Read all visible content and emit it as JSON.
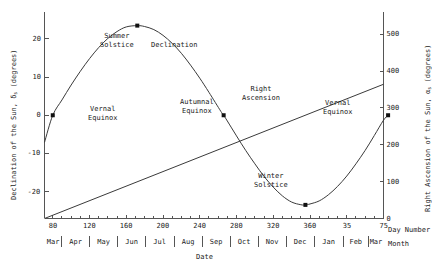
{
  "chart_data": {
    "type": "line",
    "title": "",
    "xlabel": "Date",
    "x2label": "Day Number",
    "x3label": "Month",
    "ylabel": "Declination of the Sun, δs (degrees)",
    "y2label": "Right Ascension of the Sun, αs (degrees)",
    "xlim": [
      71,
      440
    ],
    "ylim": [
      -27,
      27
    ],
    "y2lim": [
      0,
      560
    ],
    "grid": false,
    "legend": "none",
    "x_ticks": [
      {
        "day": 80,
        "label": "80"
      },
      {
        "day": 120,
        "label": "120"
      },
      {
        "day": 160,
        "label": "160"
      },
      {
        "day": 200,
        "label": "200"
      },
      {
        "day": 240,
        "label": "240"
      },
      {
        "day": 280,
        "label": "280"
      },
      {
        "day": 320,
        "label": "320"
      },
      {
        "day": 360,
        "label": "360"
      },
      {
        "day": 400,
        "label": "35"
      },
      {
        "day": 440,
        "label": "75"
      }
    ],
    "y_ticks": [
      {
        "value": 20,
        "label": "20"
      },
      {
        "value": 10,
        "label": "10"
      },
      {
        "value": 0,
        "label": "0"
      },
      {
        "value": -10,
        "label": "-10"
      },
      {
        "value": -20,
        "label": "-20"
      }
    ],
    "y2_ticks": [
      {
        "value": 500,
        "label": "500"
      },
      {
        "value": 400,
        "label": "400"
      },
      {
        "value": 300,
        "label": "300"
      },
      {
        "value": 200,
        "label": "200"
      },
      {
        "value": 100,
        "label": "100"
      },
      {
        "value": 0,
        "label": "0"
      }
    ],
    "months": [
      {
        "label": "Mar",
        "start": 60,
        "end": 90
      },
      {
        "label": "Apr",
        "start": 90,
        "end": 120
      },
      {
        "label": "May",
        "start": 120,
        "end": 151
      },
      {
        "label": "Jun",
        "start": 151,
        "end": 181
      },
      {
        "label": "Jul",
        "start": 181,
        "end": 212
      },
      {
        "label": "Aug",
        "start": 212,
        "end": 243
      },
      {
        "label": "Sep",
        "start": 243,
        "end": 273
      },
      {
        "label": "Oct",
        "start": 273,
        "end": 304
      },
      {
        "label": "Nov",
        "start": 304,
        "end": 334
      },
      {
        "label": "Dec",
        "start": 334,
        "end": 365
      },
      {
        "label": "Jan",
        "start": 365,
        "end": 396
      },
      {
        "label": "Feb",
        "start": 396,
        "end": 424
      },
      {
        "label": "Mar",
        "start": 424,
        "end": 455
      }
    ],
    "series": [
      {
        "name": "Declination",
        "unit": "degrees",
        "axis": "left",
        "points": [
          {
            "day": 71,
            "value": -7.1
          },
          {
            "day": 80,
            "value": 0.0
          },
          {
            "day": 90,
            "value": 4.0
          },
          {
            "day": 100,
            "value": 7.9
          },
          {
            "day": 110,
            "value": 11.5
          },
          {
            "day": 120,
            "value": 14.8
          },
          {
            "day": 130,
            "value": 17.7
          },
          {
            "day": 140,
            "value": 20.1
          },
          {
            "day": 150,
            "value": 21.9
          },
          {
            "day": 160,
            "value": 23.1
          },
          {
            "day": 172,
            "value": 23.44
          },
          {
            "day": 180,
            "value": 23.2
          },
          {
            "day": 190,
            "value": 22.4
          },
          {
            "day": 200,
            "value": 20.9
          },
          {
            "day": 210,
            "value": 18.8
          },
          {
            "day": 220,
            "value": 16.2
          },
          {
            "day": 230,
            "value": 13.1
          },
          {
            "day": 240,
            "value": 9.7
          },
          {
            "day": 250,
            "value": 6.0
          },
          {
            "day": 263,
            "value": 1.0
          },
          {
            "day": 266,
            "value": 0.0
          },
          {
            "day": 270,
            "value": -1.5
          },
          {
            "day": 280,
            "value": -5.4
          },
          {
            "day": 290,
            "value": -9.2
          },
          {
            "day": 300,
            "value": -12.7
          },
          {
            "day": 310,
            "value": -16.0
          },
          {
            "day": 320,
            "value": -18.8
          },
          {
            "day": 330,
            "value": -21.1
          },
          {
            "day": 340,
            "value": -22.7
          },
          {
            "day": 350,
            "value": -23.4
          },
          {
            "day": 355,
            "value": -23.44
          },
          {
            "day": 360,
            "value": -23.2
          },
          {
            "day": 370,
            "value": -22.4
          },
          {
            "day": 380,
            "value": -20.8
          },
          {
            "day": 390,
            "value": -18.6
          },
          {
            "day": 400,
            "value": -15.9
          },
          {
            "day": 410,
            "value": -12.7
          },
          {
            "day": 420,
            "value": -9.2
          },
          {
            "day": 430,
            "value": -5.3
          },
          {
            "day": 440,
            "value": -1.3
          },
          {
            "day": 445,
            "value": 0.0
          }
        ]
      },
      {
        "name": "Right Ascension",
        "unit": "degrees",
        "axis": "right",
        "points": [
          {
            "day": 71,
            "value": 0
          },
          {
            "day": 440,
            "value": 364
          }
        ]
      }
    ],
    "markers": [
      {
        "label": "Vernal Equinox",
        "day": 80,
        "value": 0.0,
        "label_x": 88,
        "label_y": 105,
        "align": "left"
      },
      {
        "label": "Summer Solstice",
        "day": 172,
        "value": 23.44,
        "label_x": 117,
        "label_y": 32,
        "align": "center"
      },
      {
        "label": "Autumnal Equinox",
        "day": 266,
        "value": 0.0,
        "label_x": 197,
        "label_y": 98,
        "align": "center"
      },
      {
        "label": "Winter Solstice",
        "day": 355,
        "value": -23.44,
        "label_x": 271,
        "label_y": 172,
        "align": "center"
      },
      {
        "label": "Vernal Equinox",
        "day": 445,
        "value": 0.0,
        "label_x": 338,
        "label_y": 99,
        "align": "center"
      }
    ],
    "curve_labels": [
      {
        "text": "Declination",
        "x": 174,
        "y": 41
      },
      {
        "text": "Right Ascension",
        "x": 261,
        "y": 85
      }
    ]
  }
}
